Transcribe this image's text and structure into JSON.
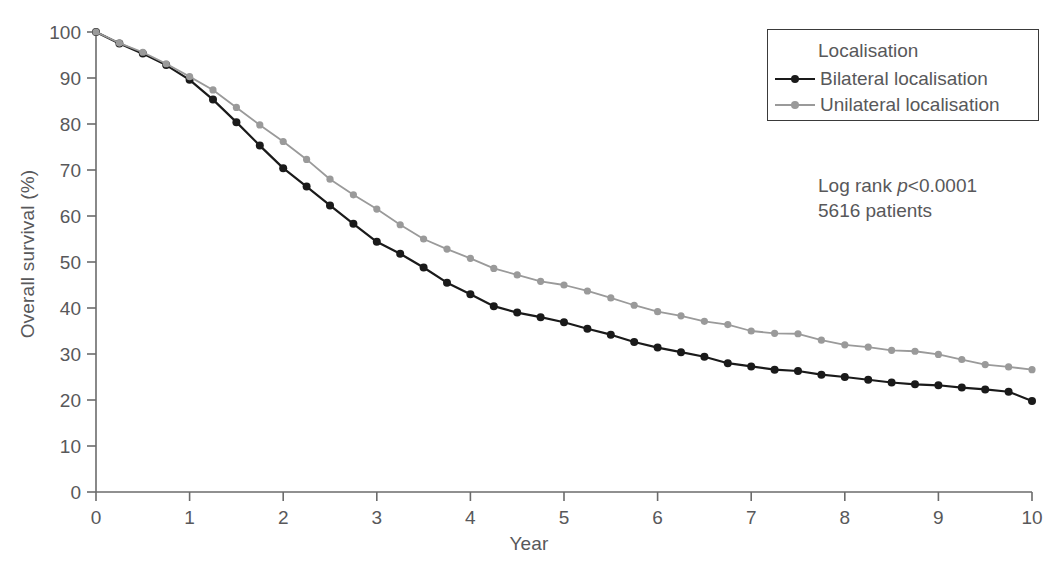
{
  "chart_data": {
    "type": "line",
    "title": "",
    "xlabel": "Year",
    "ylabel": "Overall survival (%)",
    "xlim": [
      0,
      10
    ],
    "ylim": [
      0,
      100
    ],
    "xticks": [
      "0",
      "1",
      "2",
      "3",
      "4",
      "5",
      "6",
      "7",
      "8",
      "9",
      "10"
    ],
    "yticks": [
      "0",
      "10",
      "20",
      "30",
      "40",
      "50",
      "60",
      "70",
      "80",
      "90",
      "100"
    ],
    "grid": false,
    "legend_position": "top-right",
    "legend_title": "Localisation",
    "x": [
      0,
      0.25,
      0.5,
      0.75,
      1,
      1.25,
      1.5,
      1.75,
      2,
      2.25,
      2.5,
      2.75,
      3,
      3.25,
      3.5,
      3.75,
      4,
      4.25,
      4.5,
      4.75,
      5,
      5.25,
      5.5,
      5.75,
      6,
      6.25,
      6.5,
      6.75,
      7,
      7.25,
      7.5,
      7.75,
      8,
      8.25,
      8.5,
      8.75,
      9,
      9.25,
      9.5,
      9.75,
      10
    ],
    "series": [
      {
        "name": "Bilateral localisation",
        "color": "#1a1a1a",
        "marker": "circle",
        "values": [
          100,
          97.5,
          95.3,
          92.8,
          89.6,
          85.3,
          80.4,
          75.3,
          70.4,
          66.4,
          62.3,
          58.3,
          54.4,
          51.8,
          48.8,
          45.5,
          43.0,
          40.4,
          39.0,
          38.0,
          36.9,
          35.5,
          34.2,
          32.6,
          31.4,
          30.4,
          29.4,
          28.0,
          27.3,
          26.6,
          26.3,
          25.5,
          25.0,
          24.4,
          23.8,
          23.4,
          23.2,
          22.7,
          22.3,
          21.8,
          19.8
        ]
      },
      {
        "name": "Unilateral localisation",
        "color": "#9a9a9a",
        "marker": "circle",
        "values": [
          100,
          97.6,
          95.6,
          93.1,
          90.3,
          87.4,
          83.6,
          79.8,
          76.2,
          72.3,
          68.0,
          64.6,
          61.5,
          58.1,
          55.0,
          52.8,
          50.8,
          48.6,
          47.2,
          45.8,
          45.0,
          43.7,
          42.2,
          40.6,
          39.2,
          38.3,
          37.1,
          36.4,
          35.0,
          34.5,
          34.4,
          33.0,
          32.0,
          31.5,
          30.8,
          30.6,
          29.9,
          28.8,
          27.7,
          27.2,
          26.6
        ]
      }
    ],
    "annotations": [
      {
        "text": "Log rank p<0.0001",
        "prefix": "Log rank ",
        "italic": "p",
        "suffix": "<0.0001"
      },
      {
        "text": "5616 patients"
      }
    ]
  },
  "colors": {
    "axis": "#6b6b6b",
    "text": "#58585a",
    "bilateral": "#1a1a1a",
    "unilateral": "#9a9a9a",
    "legend_border": "#3a3a3a",
    "background": "#ffffff"
  }
}
